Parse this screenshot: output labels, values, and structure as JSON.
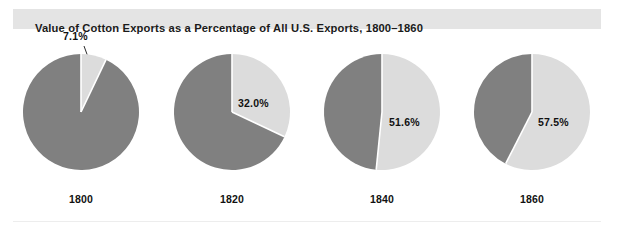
{
  "figure": {
    "title": "Value of Cotton Exports as a Percentage of All U.S. Exports, 1800–1860",
    "background_color": "#ffffff",
    "title_band_color": "#e4e4e4",
    "title_text_color": "#1a1a1a",
    "rule_color": "#ededed"
  },
  "chart_data": {
    "type": "pie",
    "title": "Value of Cotton Exports as a Percentage of All U.S. Exports, 1800–1860",
    "xlabel": "",
    "ylabel": "",
    "grid": false,
    "legend": "none",
    "series_names": [
      "Cotton exports",
      "All other exports"
    ],
    "slice_colors": {
      "cotton": "#dcdcdc",
      "other": "#808080",
      "separator": "#ffffff"
    },
    "units": "percent of all U.S. exports",
    "start_angle_deg": 0,
    "direction": "clockwise",
    "categories": [
      "1800",
      "1820",
      "1840",
      "1860"
    ],
    "values": [
      7.1,
      32.0,
      51.6,
      57.5
    ],
    "charts": [
      {
        "year": "1800",
        "cotton_percent": 7.1,
        "other_percent": 92.9,
        "label": "7.1%",
        "label_placement": "outside-leader",
        "center_x": 81,
        "radius": 58
      },
      {
        "year": "1820",
        "cotton_percent": 32.0,
        "other_percent": 68.0,
        "label": "32.0%",
        "label_placement": "inside",
        "center_x": 232,
        "radius": 58
      },
      {
        "year": "1840",
        "cotton_percent": 51.6,
        "other_percent": 48.4,
        "label": "51.6%",
        "label_placement": "inside",
        "center_x": 382,
        "radius": 58
      },
      {
        "year": "1860",
        "cotton_percent": 57.5,
        "other_percent": 42.5,
        "label": "57.5%",
        "label_placement": "inside",
        "center_x": 532,
        "radius": 58
      }
    ]
  }
}
